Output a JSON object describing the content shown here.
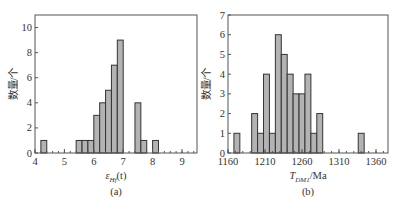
{
  "chart_data": [
    {
      "type": "bar",
      "panel": "(a)",
      "title": "",
      "xlabel": "εHf(t)",
      "ylabel": "数量/个",
      "xlim": [
        4,
        9.5
      ],
      "ylim": [
        0,
        11
      ],
      "xticks": [
        4,
        5,
        6,
        7,
        8,
        9
      ],
      "yticks": [
        0,
        2,
        4,
        6,
        8,
        10
      ],
      "bin_width": 0.2,
      "bins": [
        {
          "start": 4.2,
          "end": 4.4,
          "count": 1
        },
        {
          "start": 5.4,
          "end": 5.6,
          "count": 1
        },
        {
          "start": 5.6,
          "end": 5.8,
          "count": 1
        },
        {
          "start": 5.8,
          "end": 6.0,
          "count": 1
        },
        {
          "start": 6.0,
          "end": 6.2,
          "count": 3
        },
        {
          "start": 6.2,
          "end": 6.4,
          "count": 4
        },
        {
          "start": 6.4,
          "end": 6.6,
          "count": 5
        },
        {
          "start": 6.6,
          "end": 6.8,
          "count": 7
        },
        {
          "start": 6.8,
          "end": 7.0,
          "count": 9
        },
        {
          "start": 7.4,
          "end": 7.6,
          "count": 4
        },
        {
          "start": 7.6,
          "end": 7.8,
          "count": 1
        },
        {
          "start": 8.0,
          "end": 8.2,
          "count": 1
        }
      ],
      "grid": false,
      "legend": null
    },
    {
      "type": "bar",
      "panel": "(b)",
      "title": "",
      "xlabel": "TDM1/Ma",
      "ylabel": "数量/个",
      "xlim": [
        1160,
        1370
      ],
      "ylim": [
        0,
        7
      ],
      "xticks": [
        1160,
        1210,
        1260,
        1310,
        1360
      ],
      "yticks": [
        0,
        1,
        2,
        3,
        4,
        5,
        6,
        7
      ],
      "bin_width": 8,
      "bins": [
        {
          "start": 1168,
          "end": 1176,
          "count": 1
        },
        {
          "start": 1192,
          "end": 1200,
          "count": 2
        },
        {
          "start": 1200,
          "end": 1208,
          "count": 1
        },
        {
          "start": 1208,
          "end": 1216,
          "count": 4
        },
        {
          "start": 1216,
          "end": 1224,
          "count": 1
        },
        {
          "start": 1224,
          "end": 1232,
          "count": 6
        },
        {
          "start": 1232,
          "end": 1240,
          "count": 5
        },
        {
          "start": 1240,
          "end": 1248,
          "count": 4
        },
        {
          "start": 1248,
          "end": 1256,
          "count": 3
        },
        {
          "start": 1256,
          "end": 1264,
          "count": 3
        },
        {
          "start": 1264,
          "end": 1272,
          "count": 4
        },
        {
          "start": 1272,
          "end": 1280,
          "count": 1
        },
        {
          "start": 1280,
          "end": 1288,
          "count": 2
        },
        {
          "start": 1336,
          "end": 1344,
          "count": 1
        }
      ],
      "grid": false,
      "legend": null
    }
  ],
  "labels": {
    "a": {
      "ylabel": "数量/个",
      "xlabel_main": "ε",
      "xlabel_sub": "Hf",
      "xlabel_tail": "(t)",
      "panel": "(a)"
    },
    "b": {
      "ylabel": "数量/个",
      "xlabel_main": "T",
      "xlabel_sub": "DM1",
      "xlabel_tail": "/Ma",
      "panel": "(b)"
    }
  },
  "colors": {
    "bar_fill": "#b3b3b3",
    "bar_stroke": "#333333",
    "axis": "#555555"
  }
}
